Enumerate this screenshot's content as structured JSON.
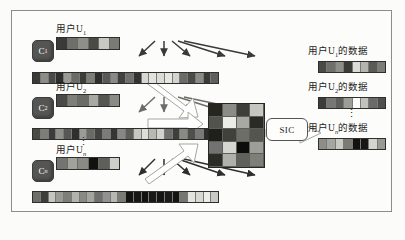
{
  "figure": {
    "title_text": "",
    "frame_color": "#8d8d86",
    "background": "#fcfcfa"
  },
  "left_groups": [
    {
      "id": "group-1",
      "cluster_label": "C",
      "cluster_sub": "1",
      "user_label_prefix": "用户U",
      "user_label_sub": "1",
      "user_label_suffix": "",
      "packet_cells": [
        "#3a3a38",
        "#6e6e6a",
        "#8f8f8a",
        "#4a4a47",
        "#c9c9c4",
        "#7b7b76"
      ],
      "frame_cells": [
        "#3a3a38",
        "#8d8d88",
        "#4a4a47",
        "#2f2f2d",
        "#9a9a94",
        "#6b6b67",
        "#3c3c39",
        "#7d7d78",
        "#2e2e2c",
        "#5a5a56",
        "#8a8a85",
        "#404040",
        "#6f6f6b",
        "#333331",
        "#d8d8d3",
        "#e2e2de",
        "#dcdcd7",
        "#e6e6e2",
        "#d4d4cf",
        "#6b6b67",
        "#4b4b48",
        "#8c8c87",
        "#3a3a38",
        "#5f5f5b"
      ],
      "arrow_color": "#3a3a38"
    },
    {
      "id": "group-2",
      "cluster_label": "C",
      "cluster_sub": "2",
      "user_label_prefix": "用户U",
      "user_label_sub": "2",
      "user_label_suffix": "",
      "packet_cells": [
        "#4a4a47",
        "#7f7f7a",
        "#6b6b67",
        "#a9a9a3",
        "#555551",
        "#8b8b86"
      ],
      "frame_cells": [
        "#4a4a47",
        "#7e7e79",
        "#3c3c3a",
        "#8f8f8a",
        "#575753",
        "#2f2f2d",
        "#9c9c97",
        "#6a6a66",
        "#444441",
        "#7c7c77",
        "#353533",
        "#888883",
        "#5d5d59",
        "#c7c7c2",
        "#dedeD9",
        "#b9b9b4",
        "#d2d2cd",
        "#70706c",
        "#3e3e3b",
        "#8a8a85",
        "#4f4f4c",
        "#7a7a75",
        "#2d2d2b",
        "#666662"
      ],
      "arrow_color": "#6d6d68"
    },
    {
      "id": "group-n",
      "cluster_label": "C",
      "cluster_sub": "n",
      "user_label_prefix": "用户U",
      "user_label_sub": "n",
      "user_label_suffix": "",
      "packet_cells": [
        "#747470",
        "#a2a29d",
        "#8a8a85",
        "#111110",
        "#5e5e5a",
        "#cfcfca"
      ],
      "frame_cells": [
        "#6d6d69",
        "#3d3d3a",
        "#c6c6c1",
        "#9b9b96",
        "#7f7f7a",
        "#b3b3ae",
        "#8a8a85",
        "#a5a5a0",
        "#6f6f6b",
        "#929290",
        "#b8b8b3",
        "#7c7c77",
        "#141413",
        "#171716",
        "#121211",
        "#191918",
        "#151514",
        "#1b1b1a",
        "#141413",
        "#777772",
        "#e4e4df",
        "#d9d9d4",
        "#ececE8",
        "#cacac5"
      ],
      "arrow_color": "#2e2e2c"
    }
  ],
  "inter_group_dots": "⋮",
  "matrix": {
    "name": "combined-signal-matrix",
    "cols": 4,
    "rows": 5,
    "cells": [
      "#26261f",
      "#8c8c86",
      "#3f3f3a",
      "#c7c7c1",
      "#53534e",
      "#ededE7",
      "#a9a9a3",
      "#2a2a26",
      "#1f1f1b",
      "#41413c",
      "#6e6e68",
      "#55554f",
      "#727270",
      "#d6d6d0",
      "#0d0d0b",
      "#9e9e98",
      "#2b2b27",
      "#b1b1ab",
      "#61615c",
      "#7f7f79"
    ]
  },
  "sic": {
    "label": "SIC",
    "name": "sic-processor"
  },
  "big_arrows": [
    {
      "name": "arrow-group-1-to-matrix"
    },
    {
      "name": "arrow-group-2-to-matrix"
    },
    {
      "name": "arrow-group-n-to-matrix"
    },
    {
      "name": "arrow-sic-to-outputs"
    }
  ],
  "outputs": [
    {
      "id": "output-1",
      "label_prefix": "用户U",
      "label_sub": "1",
      "label_suffix": "的数据",
      "cells": [
        "#4a4a47",
        "#6f6f6b",
        "#8f8f8a",
        "#3b3b38",
        "#dcdcd7",
        "#b4b4af",
        "#5a5a56",
        "#7d7d78"
      ]
    },
    {
      "id": "output-2",
      "label_prefix": "用户U",
      "label_sub": "2",
      "label_suffix": "的数据",
      "cells": [
        "#3c3c39",
        "#787873",
        "#5e5e5a",
        "#9d9d98",
        "#44444 1",
        "#c2c2bd",
        "#6b6b67",
        "#4f4f4c"
      ]
    },
    {
      "id": "output-n",
      "label_prefix": "用户U",
      "label_sub": "n",
      "label_suffix": "的数据",
      "cells": [
        "#8e8e89",
        "#a6a6a1",
        "#c9c9c4",
        "#7b7b76",
        "#121210",
        "#171715",
        "#d4d4cf",
        "#9a9a95"
      ]
    }
  ],
  "output_dots": "⋮"
}
